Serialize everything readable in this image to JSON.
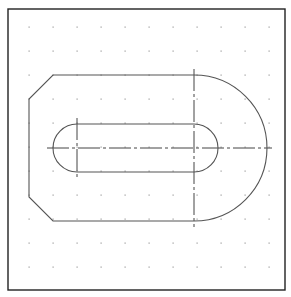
{
  "drawing": {
    "title": "",
    "colors": {
      "background": "#ffffff",
      "frame": "#222222",
      "geometry": "#555555",
      "centerline": "#444444",
      "grid_dot": "#9a9a9a"
    },
    "frame": {
      "x": 8,
      "y": 9,
      "width": 277,
      "height": 281
    },
    "grid": {
      "x": [
        29,
        53,
        77,
        101,
        125,
        149,
        173,
        197,
        221,
        245,
        269
      ],
      "y": [
        27,
        51,
        75,
        99,
        123,
        147,
        171,
        195,
        219,
        243,
        267
      ]
    },
    "outer_profile": {
      "left_x": 29,
      "chamfer_top": [
        [
          29,
          99
        ],
        [
          53,
          75
        ]
      ],
      "chamfer_bottom": [
        [
          29,
          197
        ],
        [
          53,
          221
        ]
      ],
      "top_y": 75,
      "bottom_y": 221,
      "straight_end_x": 194,
      "arc_center": [
        194,
        148
      ],
      "arc_radius": 73
    },
    "slot": {
      "left_center": [
        77,
        148
      ],
      "right_center": [
        194,
        148
      ],
      "radius": 24
    },
    "centerlines": {
      "horizontal": {
        "y": 148,
        "x1": 47,
        "x2": 272
      },
      "vertical_right": {
        "x": 194,
        "y1": 69,
        "y2": 227
      },
      "vertical_left": {
        "x": 77,
        "y1": 118,
        "y2": 178
      }
    }
  }
}
